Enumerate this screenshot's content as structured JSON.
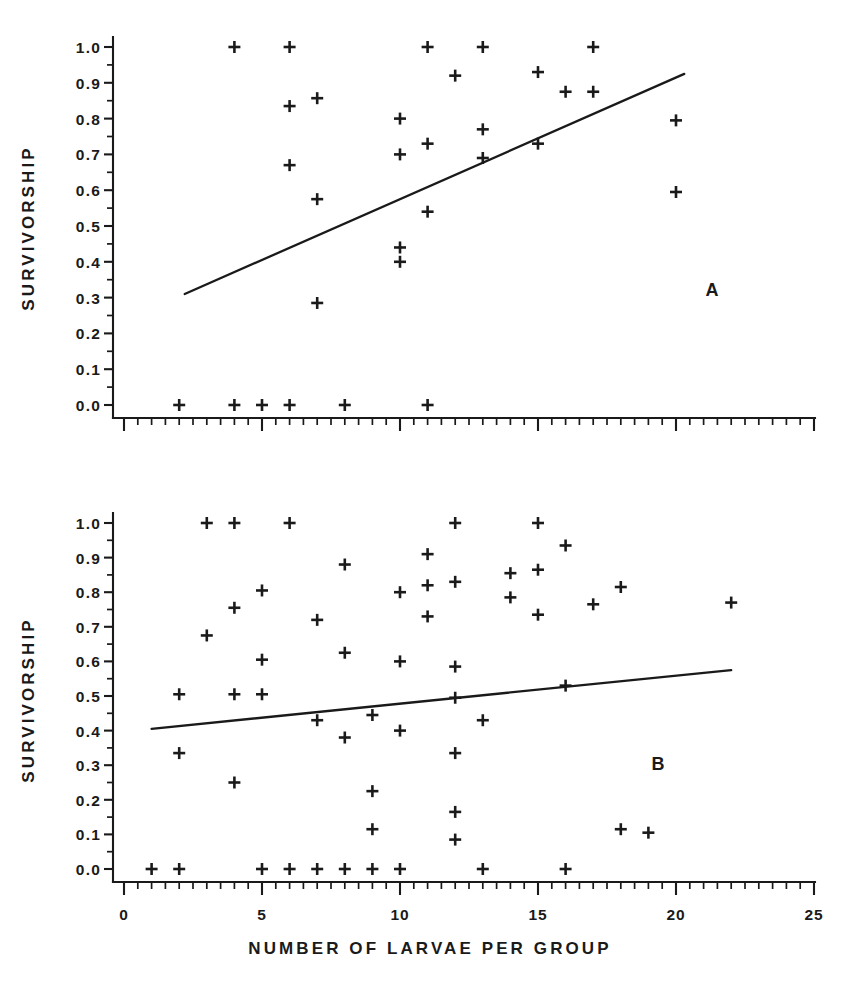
{
  "figure": {
    "width": 859,
    "height": 985,
    "background": "#ffffff",
    "ink_color": "#1a1a1a"
  },
  "axis_titles": {
    "y": "SURVIVORSHIP",
    "x": "NUMBER OF LARVAE PER GROUP"
  },
  "panel_labels": {
    "a": "A",
    "b": "B"
  },
  "y_tick_labels": [
    "0.0",
    "0.1",
    "0.2",
    "0.3",
    "0.4",
    "0.5",
    "0.6",
    "0.7",
    "0.8",
    "0.9",
    "1.0"
  ],
  "x_tick_labels": [
    "0",
    "5",
    "10",
    "15",
    "20",
    "25"
  ],
  "chart_data": [
    {
      "type": "scatter",
      "panel": "A",
      "title": "",
      "xlabel": "NUMBER OF LARVAE PER GROUP",
      "ylabel": "SURVIVORSHIP",
      "xlim": [
        0,
        25
      ],
      "ylim": [
        0.0,
        1.0
      ],
      "xticks": [
        0,
        5,
        10,
        15,
        20,
        25
      ],
      "yticks": [
        0.0,
        0.1,
        0.2,
        0.3,
        0.4,
        0.5,
        0.6,
        0.7,
        0.8,
        0.9,
        1.0
      ],
      "minor_xtick_step": 0.5,
      "minor_ytick_step": 0.05,
      "grid": false,
      "legend": false,
      "marker": "plus",
      "points": [
        {
          "x": 2,
          "y": 0.0
        },
        {
          "x": 4,
          "y": 0.0
        },
        {
          "x": 5,
          "y": 0.0
        },
        {
          "x": 6,
          "y": 0.0
        },
        {
          "x": 8,
          "y": 0.0
        },
        {
          "x": 11,
          "y": 0.0
        },
        {
          "x": 4,
          "y": 1.0
        },
        {
          "x": 6,
          "y": 1.0
        },
        {
          "x": 11,
          "y": 1.0
        },
        {
          "x": 13,
          "y": 1.0
        },
        {
          "x": 17,
          "y": 1.0
        },
        {
          "x": 6,
          "y": 0.835
        },
        {
          "x": 7,
          "y": 0.857
        },
        {
          "x": 6,
          "y": 0.67
        },
        {
          "x": 7,
          "y": 0.575
        },
        {
          "x": 7,
          "y": 0.285
        },
        {
          "x": 10,
          "y": 0.8
        },
        {
          "x": 10,
          "y": 0.7
        },
        {
          "x": 10,
          "y": 0.44
        },
        {
          "x": 10,
          "y": 0.4
        },
        {
          "x": 11,
          "y": 0.73
        },
        {
          "x": 11,
          "y": 0.54
        },
        {
          "x": 12,
          "y": 0.92
        },
        {
          "x": 13,
          "y": 0.77
        },
        {
          "x": 13,
          "y": 0.69
        },
        {
          "x": 15,
          "y": 0.93
        },
        {
          "x": 15,
          "y": 0.73
        },
        {
          "x": 16,
          "y": 0.875
        },
        {
          "x": 17,
          "y": 0.875
        },
        {
          "x": 20,
          "y": 0.795
        },
        {
          "x": 20,
          "y": 0.595
        }
      ],
      "fit_line": {
        "x0": 2.2,
        "y0": 0.31,
        "x1": 20.3,
        "y1": 0.925
      }
    },
    {
      "type": "scatter",
      "panel": "B",
      "title": "",
      "xlabel": "NUMBER OF LARVAE PER GROUP",
      "ylabel": "SURVIVORSHIP",
      "xlim": [
        0,
        25
      ],
      "ylim": [
        0.0,
        1.0
      ],
      "xticks": [
        0,
        5,
        10,
        15,
        20,
        25
      ],
      "yticks": [
        0.0,
        0.1,
        0.2,
        0.3,
        0.4,
        0.5,
        0.6,
        0.7,
        0.8,
        0.9,
        1.0
      ],
      "minor_xtick_step": 0.5,
      "minor_ytick_step": 0.05,
      "grid": false,
      "legend": false,
      "marker": "plus",
      "points": [
        {
          "x": 1,
          "y": 0.0
        },
        {
          "x": 2,
          "y": 0.0
        },
        {
          "x": 5,
          "y": 0.0
        },
        {
          "x": 6,
          "y": 0.0
        },
        {
          "x": 7,
          "y": 0.0
        },
        {
          "x": 8,
          "y": 0.0
        },
        {
          "x": 9,
          "y": 0.0
        },
        {
          "x": 10,
          "y": 0.0
        },
        {
          "x": 13,
          "y": 0.0
        },
        {
          "x": 16,
          "y": 0.0
        },
        {
          "x": 3,
          "y": 1.0
        },
        {
          "x": 4,
          "y": 1.0
        },
        {
          "x": 6,
          "y": 1.0
        },
        {
          "x": 12,
          "y": 1.0
        },
        {
          "x": 15,
          "y": 1.0
        },
        {
          "x": 2,
          "y": 0.505
        },
        {
          "x": 2,
          "y": 0.335
        },
        {
          "x": 3,
          "y": 0.675
        },
        {
          "x": 4,
          "y": 0.755
        },
        {
          "x": 4,
          "y": 0.505
        },
        {
          "x": 4,
          "y": 0.25
        },
        {
          "x": 5,
          "y": 0.805
        },
        {
          "x": 5,
          "y": 0.605
        },
        {
          "x": 5,
          "y": 0.505
        },
        {
          "x": 7,
          "y": 0.72
        },
        {
          "x": 7,
          "y": 0.43
        },
        {
          "x": 8,
          "y": 0.88
        },
        {
          "x": 8,
          "y": 0.625
        },
        {
          "x": 8,
          "y": 0.38
        },
        {
          "x": 9,
          "y": 0.445
        },
        {
          "x": 9,
          "y": 0.225
        },
        {
          "x": 9,
          "y": 0.115
        },
        {
          "x": 10,
          "y": 0.8
        },
        {
          "x": 10,
          "y": 0.6
        },
        {
          "x": 10,
          "y": 0.4
        },
        {
          "x": 11,
          "y": 0.91
        },
        {
          "x": 11,
          "y": 0.82
        },
        {
          "x": 11,
          "y": 0.73
        },
        {
          "x": 12,
          "y": 0.83
        },
        {
          "x": 12,
          "y": 0.585
        },
        {
          "x": 12,
          "y": 0.495
        },
        {
          "x": 12,
          "y": 0.335
        },
        {
          "x": 12,
          "y": 0.165
        },
        {
          "x": 12,
          "y": 0.085
        },
        {
          "x": 13,
          "y": 0.43
        },
        {
          "x": 14,
          "y": 0.855
        },
        {
          "x": 14,
          "y": 0.785
        },
        {
          "x": 15,
          "y": 0.865
        },
        {
          "x": 15,
          "y": 0.735
        },
        {
          "x": 16,
          "y": 0.935
        },
        {
          "x": 17,
          "y": 0.765
        },
        {
          "x": 16,
          "y": 0.53
        },
        {
          "x": 18,
          "y": 0.815
        },
        {
          "x": 18,
          "y": 0.115
        },
        {
          "x": 19,
          "y": 0.105
        },
        {
          "x": 22,
          "y": 0.77
        }
      ],
      "fit_line": {
        "x0": 1.0,
        "y0": 0.405,
        "x1": 22.0,
        "y1": 0.575
      }
    }
  ]
}
